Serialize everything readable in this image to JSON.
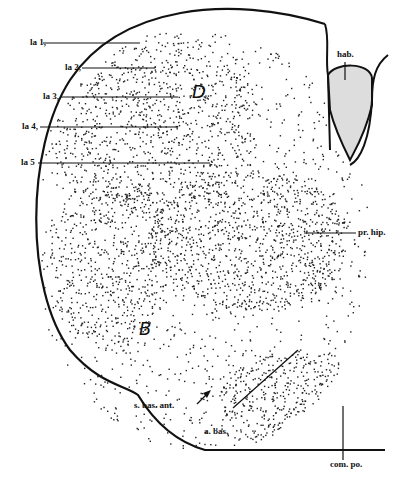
{
  "figure": {
    "labels": {
      "la1": "la 1,",
      "la2": "la 2,",
      "la3": "la 3,",
      "la4": "la 4,",
      "la5": "la 5",
      "hab": "hab.",
      "pr_hip": "pr. hip.",
      "s_bas_ant": "s. bas. ant.",
      "a_bas": "a. bas.",
      "com_po": "com. po."
    },
    "regions": {
      "D": "D",
      "B": "B"
    }
  }
}
